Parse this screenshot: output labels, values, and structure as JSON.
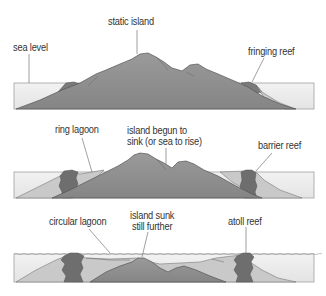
{
  "diagram": {
    "type": "process",
    "colors": {
      "water": "#ececec",
      "water_border": "#9a9a9a",
      "island": "#8f8f8f",
      "island_outline": "#555555",
      "reef": "#6e6e6e",
      "lagoon_fill": "#d2d2d2",
      "leader_line": "#777777",
      "text": "#333333"
    },
    "stages": [
      {
        "name": "stage-1",
        "labels": {
          "left": "sea level",
          "center": "static island",
          "right": "fringing reef"
        }
      },
      {
        "name": "stage-2",
        "labels": {
          "left": "ring lagoon",
          "center_line1": "island begun to",
          "center_line2": "sink (or sea to rise)",
          "right": "barrier reef"
        }
      },
      {
        "name": "stage-3",
        "labels": {
          "left": "circular lagoon",
          "center_line1": "island sunk",
          "center_line2": "still further",
          "right": "atoll reef"
        }
      }
    ]
  }
}
